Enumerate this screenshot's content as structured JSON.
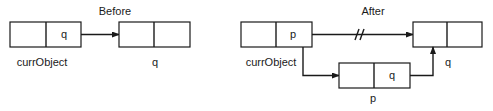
{
  "before": {
    "title": "Before",
    "node_current": {
      "left_cell": "",
      "right_cell": "q",
      "label": "currObject"
    },
    "node_q": {
      "left_cell": "",
      "right_cell": "",
      "label": "q"
    }
  },
  "after": {
    "title": "After",
    "node_current": {
      "left_cell": "",
      "right_cell": "p",
      "label": "currObject"
    },
    "node_q": {
      "left_cell": "",
      "right_cell": "",
      "label": "q"
    },
    "node_p": {
      "left_cell": "",
      "right_cell": "q",
      "label": "p"
    },
    "broken_link_marker": "//"
  },
  "colors": {
    "stroke": "#1a1a1a",
    "background": "#ffffff"
  }
}
